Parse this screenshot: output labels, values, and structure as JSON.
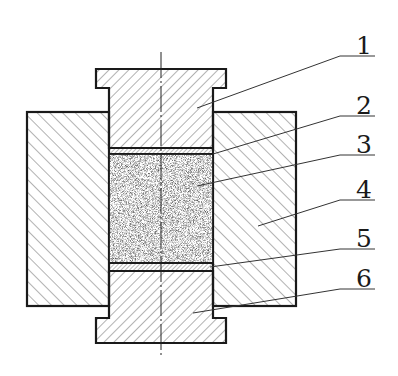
{
  "diagram": {
    "type": "cross-section",
    "colors": {
      "outline": "#1a1a1a",
      "hatch": "#444444",
      "powder": "#9a9a9a",
      "background": "#ffffff"
    },
    "labels": [
      {
        "id": "1",
        "text": "1",
        "part": "upper-punch"
      },
      {
        "id": "2",
        "text": "2",
        "part": "upper-spacer-layer"
      },
      {
        "id": "3",
        "text": "3",
        "part": "powder-sample"
      },
      {
        "id": "4",
        "text": "4",
        "part": "die"
      },
      {
        "id": "5",
        "text": "5",
        "part": "lower-spacer-layer"
      },
      {
        "id": "6",
        "text": "6",
        "part": "lower-punch"
      }
    ]
  }
}
